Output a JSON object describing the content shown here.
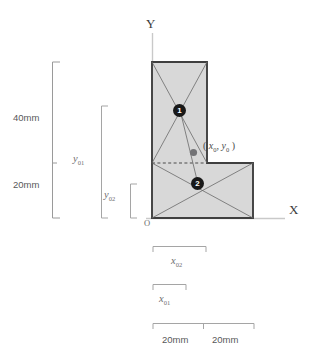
{
  "figure": {
    "type": "engineering-geometry-diagram",
    "axes": {
      "x_label": "X",
      "y_label": "Y",
      "origin_label": "O"
    },
    "shape": {
      "fill_color": "#d6d6d6",
      "stroke_color": "#3a3a3a",
      "outline_points": "0,0 0,156 55,156 55,55 101,55 101,0",
      "parts": [
        {
          "id": 1,
          "badge": "1",
          "name": "vertical-leg",
          "centroid_px": [
            180,
            110
          ]
        },
        {
          "id": 2,
          "badge": "2",
          "name": "horizontal-foot",
          "centroid_px": [
            198,
            184
          ]
        }
      ]
    },
    "centroid": {
      "marker_color": "#6e6e70",
      "label_open": "( ",
      "label_x": "x",
      "label_x_sub": "0",
      "label_comma": ", ",
      "label_y": "y",
      "label_y_sub": "0",
      "label_close": " )"
    },
    "dimensions_vertical": [
      {
        "name": "upper-segment",
        "label": "40mm"
      },
      {
        "name": "lower-segment",
        "label": "20mm"
      },
      {
        "name": "centroid-y-part1",
        "label_base": "y",
        "label_sub": "01"
      },
      {
        "name": "centroid-y-part2",
        "label_base": "y",
        "label_sub": "02"
      }
    ],
    "dimensions_horizontal": [
      {
        "name": "centroid-x-part2",
        "label_base": "x",
        "label_sub": "02"
      },
      {
        "name": "centroid-x-part1",
        "label_base": "x",
        "label_sub": "01"
      },
      {
        "name": "width-left",
        "label": "20mm"
      },
      {
        "name": "width-right",
        "label": "20mm"
      }
    ]
  }
}
